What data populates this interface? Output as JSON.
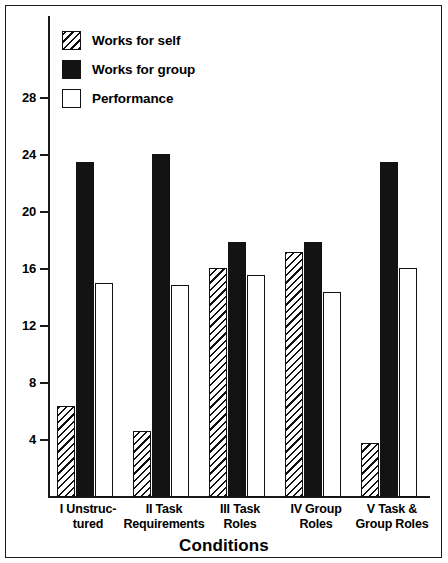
{
  "chart_data": {
    "type": "bar",
    "title": "",
    "xlabel": "Conditions",
    "ylabel": "",
    "ylim": [
      0,
      30
    ],
    "yticks": [
      4,
      8,
      12,
      16,
      20,
      24,
      28
    ],
    "grid": false,
    "legend_position": "top-left",
    "categories": [
      "I Unstruc-\ntured",
      "II Task\nRequirements",
      "III Task\nRoles",
      "IV Group\nRoles",
      "V Task &\nGroup Roles"
    ],
    "category_lines": [
      [
        "I Unstruc-",
        "tured"
      ],
      [
        "II Task",
        "Requirements"
      ],
      [
        "III Task",
        "Roles"
      ],
      [
        "IV Group",
        "Roles"
      ],
      [
        "V Task &",
        "Group Roles"
      ]
    ],
    "series": [
      {
        "name": "Works for self",
        "fill": "diagonal-hatch",
        "values": [
          6.4,
          4.6,
          16.1,
          17.2,
          3.8
        ]
      },
      {
        "name": "Works for group",
        "fill": "solid-black",
        "values": [
          23.5,
          24.1,
          17.9,
          17.9,
          23.5
        ]
      },
      {
        "name": "Performance",
        "fill": "white-outline",
        "values": [
          15.0,
          14.9,
          15.6,
          14.4,
          16.1
        ]
      }
    ]
  },
  "legend": {
    "items": [
      {
        "label": "Works for self",
        "swatch": "diagonal-hatch"
      },
      {
        "label": "Works for group",
        "swatch": "solid-black"
      },
      {
        "label": "Performance",
        "swatch": "white-outline"
      }
    ]
  },
  "axes": {
    "x_title": "Conditions",
    "y_ticks": [
      "28",
      "24",
      "20",
      "16",
      "12",
      "8",
      "4"
    ]
  },
  "colors": {
    "ink": "#131313",
    "background": "#ffffff"
  }
}
